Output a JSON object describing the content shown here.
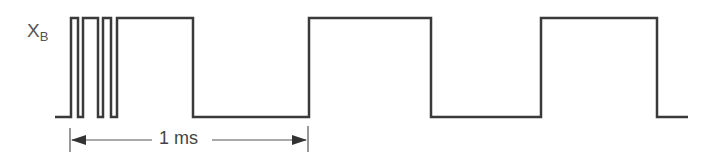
{
  "diagram": {
    "signal_name": "X",
    "signal_subscript": "B",
    "dimension_label": "1 ms",
    "colors": {
      "waveform": "#3a3a3a",
      "text": "#555555"
    },
    "waveform": {
      "high_y": 18,
      "low_y": 117,
      "start_x": 55,
      "end_x": 688,
      "edges_x": [
        71,
        78,
        83,
        98,
        103,
        111,
        117,
        193,
        309,
        431,
        541,
        657
      ]
    },
    "dimension": {
      "from_x": 70,
      "to_x": 308,
      "y": 140
    }
  }
}
